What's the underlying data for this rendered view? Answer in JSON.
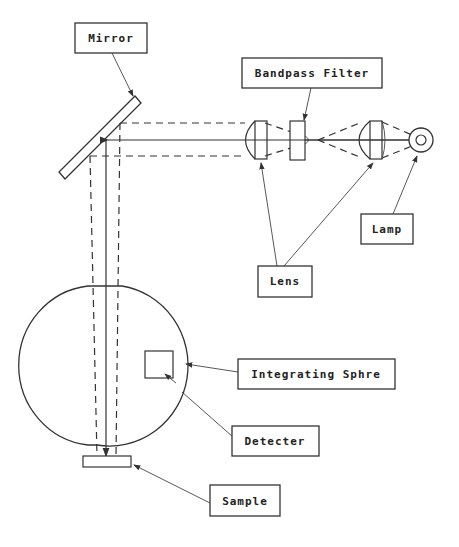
{
  "diagram": {
    "type": "optical-setup-schematic",
    "labels": {
      "mirror": "Mirror",
      "bandpass_filter": "Bandpass Filter",
      "lamp": "Lamp",
      "lens": "Lens",
      "integrating_sphere": "Integrating Sphre",
      "detector": "Detecter",
      "sample": "Sample"
    },
    "components": [
      "Lamp",
      "Lens",
      "Bandpass Filter",
      "Lens",
      "Mirror",
      "Integrating Sphre",
      "Detecter",
      "Sample"
    ],
    "colors": {
      "line": "#333333",
      "background": "#ffffff"
    }
  }
}
